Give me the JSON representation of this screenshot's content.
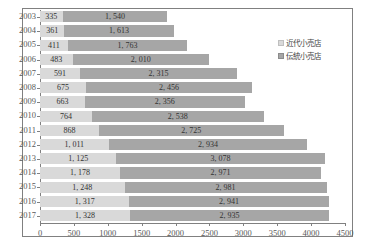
{
  "chart_data": {
    "type": "bar",
    "subtype": "horizontal-stacked",
    "title": "",
    "xlabel": "",
    "ylabel": "",
    "categories": [
      "2003",
      "2004",
      "2005",
      "2006",
      "2007",
      "2008",
      "2009",
      "2010",
      "2011",
      "2012",
      "2013",
      "2014",
      "2015",
      "2016",
      "2017"
    ],
    "series": [
      {
        "name": "近代小売店",
        "color": "#d9d9d9",
        "values": [
          335,
          361,
          411,
          483,
          591,
          675,
          663,
          764,
          868,
          1011,
          1125,
          1178,
          1248,
          1317,
          1328
        ],
        "labels": [
          "335",
          "361",
          "411",
          "483",
          "591",
          "675",
          "663",
          "764",
          "868",
          "1, 011",
          "1, 125",
          "1, 178",
          "1, 248",
          "1, 317",
          "1, 328"
        ]
      },
      {
        "name": "伝統小売店",
        "color": "#a6a6a6",
        "values": [
          1540,
          1613,
          1763,
          2010,
          2315,
          2456,
          2356,
          2538,
          2725,
          2934,
          3078,
          2971,
          2981,
          2941,
          2935
        ],
        "labels": [
          "1, 540",
          "1, 613",
          "1, 763",
          "2, 010",
          "2, 315",
          "2, 456",
          "2, 356",
          "2, 538",
          "2, 725",
          "2, 934",
          "3, 078",
          "2, 971",
          "2, 981",
          "2, 941",
          "2, 935"
        ]
      }
    ],
    "xlim": [
      0,
      4500
    ],
    "xticks": [
      0,
      500,
      1000,
      1500,
      2000,
      2500,
      3000,
      3500,
      4000,
      4500
    ],
    "xtick_labels": [
      "0",
      "500",
      "1000",
      "1500",
      "2000",
      "2500",
      "3000",
      "3500",
      "4000",
      "4500"
    ],
    "grid": false,
    "legend_position": "top-right"
  },
  "legend": {
    "items": [
      {
        "label": "近代小売店",
        "color": "#d9d9d9"
      },
      {
        "label": "伝統小売店",
        "color": "#a6a6a6"
      }
    ]
  }
}
